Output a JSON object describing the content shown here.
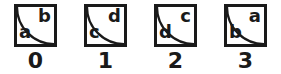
{
  "figure": {
    "options": [
      {
        "number": "0",
        "top_right_letter": "b",
        "bottom_left_letter": "a"
      },
      {
        "number": "1",
        "top_right_letter": "d",
        "bottom_left_letter": "c"
      },
      {
        "number": "2",
        "top_right_letter": "c",
        "bottom_left_letter": "d"
      },
      {
        "number": "3",
        "top_right_letter": "a",
        "bottom_left_letter": "b"
      }
    ],
    "colors": {
      "line": "#1a1a1a",
      "background": "#ffffff"
    }
  }
}
